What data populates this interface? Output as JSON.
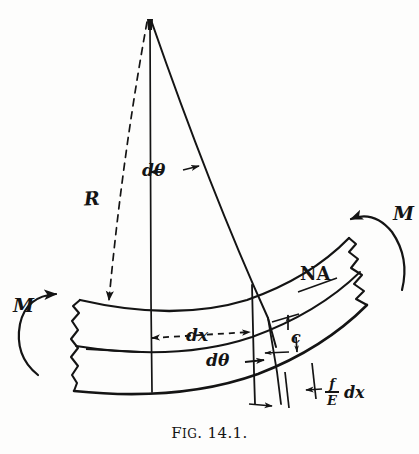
{
  "figure": {
    "caption_prefix": "F",
    "caption_smallcaps": "IG",
    "caption_number": ". 14.1.",
    "caption_full": "FIG. 14.1.",
    "background_color": "#fdfdfc",
    "ink_color": "#141414"
  },
  "labels": {
    "radius": "R",
    "d_theta_top": "dθ",
    "d_theta_bottom": "dθ",
    "dx": "dx",
    "c": "c",
    "neutral_axis": "NA",
    "moment_left": "M",
    "moment_right": "M",
    "strain_numerator": "f",
    "strain_denominator": "E",
    "strain_suffix": "dx"
  },
  "annotations": {
    "apex": "center-of-curvature-apex",
    "radius_line_style": "dashed",
    "dx_line_style": "dashed",
    "beam_ends": "jagged-broken-section",
    "moment_arrow_left_direction": "counter-clockwise",
    "moment_arrow_right_direction": "counter-clockwise"
  },
  "geometry": {
    "apex_x": 150,
    "apex_y": 18,
    "beam_left_x": 72,
    "beam_right_x": 372,
    "neutral_axis_note": "NA runs along the mid-depth of the curved beam"
  }
}
